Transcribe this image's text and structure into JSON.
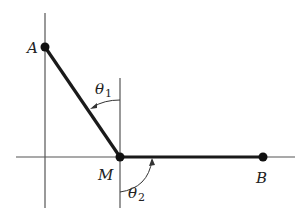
{
  "diagram": {
    "points": {
      "A": {
        "label": "A",
        "x": 45,
        "y": 47
      },
      "M": {
        "label": "M",
        "x": 120,
        "y": 157
      },
      "B": {
        "label": "B",
        "x": 263,
        "y": 157
      }
    },
    "angles": {
      "theta1": {
        "symbol": "θ",
        "subscript": "1"
      },
      "theta2": {
        "symbol": "θ",
        "subscript": "2"
      }
    },
    "colors": {
      "axis": "#555555",
      "segment": "#1a1a1a",
      "background": "#ffffff"
    }
  }
}
